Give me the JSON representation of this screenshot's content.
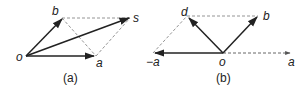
{
  "figure": {
    "panels": [
      {
        "caption": "(a)",
        "labels": {
          "o": "o",
          "a": "a",
          "b": "b",
          "s": "s"
        },
        "description": "Parallelogram rule: vectors a and b from origin o, resultant s = a + b, with dashed parallelogram sides and dashed diagonal from b to a"
      },
      {
        "caption": "(b)",
        "labels": {
          "o": "o",
          "a": "a",
          "neg_a": "−a",
          "b": "b",
          "d": "d"
        },
        "description": "Vector difference: d = b − a formed from b and −a, with dashed vector a, dashed parallelogram sides"
      }
    ]
  }
}
